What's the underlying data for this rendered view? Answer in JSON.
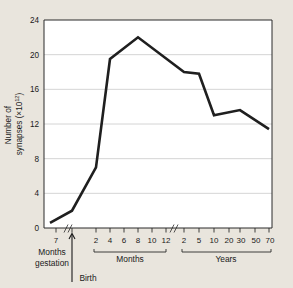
{
  "chart_data": {
    "type": "line",
    "title": "",
    "xlabel": "",
    "ylabel": "Number of\nsynapses (×10¹²)",
    "ylabel_line1": "Number of",
    "ylabel_line2": "synapses (×10",
    "ylabel_exponent": "12",
    "ylabel_line2_tail": ")",
    "ylim": [
      0,
      24
    ],
    "yticks": [
      0,
      4,
      8,
      12,
      16,
      20,
      24
    ],
    "ytick_labels": [
      "0",
      "4",
      "8",
      "12",
      "16",
      "20",
      "24"
    ],
    "grid": true,
    "legend": "none",
    "axis_segments": [
      {
        "name": "gestation",
        "group_label_line1": "Months",
        "group_label_line2": "gestation",
        "tick_labels": [
          "7"
        ],
        "unit": "months gestation"
      },
      {
        "name": "months",
        "group_label": "Months",
        "tick_labels": [
          "2",
          "4",
          "6",
          "8",
          "10",
          "12"
        ],
        "unit": "months after birth"
      },
      {
        "name": "years",
        "group_label": "Years",
        "tick_labels": [
          "2",
          "5",
          "10",
          "20",
          "30",
          "50",
          "70"
        ],
        "unit": "years"
      }
    ],
    "annotations": [
      {
        "name": "birth-marker",
        "label": "Birth",
        "note": "upward arrow marking birth on x-axis"
      },
      {
        "name": "axis-break-1",
        "label": "",
        "note": "double-slash break between gestation and months"
      },
      {
        "name": "axis-break-2",
        "label": "",
        "note": "double-slash break between months and years"
      }
    ],
    "points": [
      {
        "x_label": "7 months gestation",
        "y": 0.6
      },
      {
        "x_label": "Birth",
        "y": 2.0
      },
      {
        "x_label": "2 months",
        "y": 7.0
      },
      {
        "x_label": "4 months",
        "y": 19.5
      },
      {
        "x_label": "8 months",
        "y": 22.0
      },
      {
        "x_label": "2 years",
        "y": 18.0
      },
      {
        "x_label": "5 years",
        "y": 17.8
      },
      {
        "x_label": "10 years",
        "y": 13.0
      },
      {
        "x_label": "25 years",
        "y": 13.6
      },
      {
        "x_label": "70 years",
        "y": 11.4
      }
    ],
    "values": [
      0.6,
      2.0,
      7.0,
      19.5,
      22.0,
      18.0,
      17.8,
      13.0,
      13.6,
      11.4
    ],
    "colors": {
      "line": "#1f1f1f",
      "grid": "#c9c9c9",
      "axis": "#2b2b2b",
      "plot_background": "#ffffff",
      "page_background": "#e9e5dd"
    }
  }
}
